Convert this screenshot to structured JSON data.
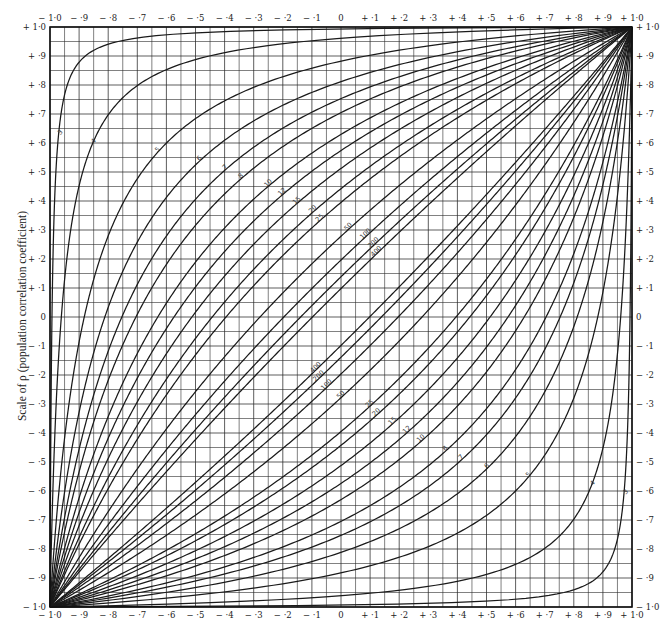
{
  "chart_data": {
    "type": "line",
    "title": "",
    "ylabel": "Scale of ρ (population correlation coefficient)",
    "xlabel": "",
    "xlim": [
      -1.0,
      1.0
    ],
    "ylim": [
      -1.0,
      1.0
    ],
    "grid": true,
    "grid_step": 0.05,
    "x_tick_labels": [
      "− 1·0",
      "− ·9",
      "− ·8",
      "− ·7",
      "− ·6",
      "− ·5",
      "− ·4",
      "− ·3",
      "− ·2",
      "− ·1",
      "0",
      "+ ·1",
      "+ ·2",
      "+ ·3",
      "+ ·4",
      "+ ·5",
      "+ ·6",
      "+ ·7",
      "+ ·8",
      "+ ·9",
      "+ 1·0"
    ],
    "y_tick_labels_left": [
      "+ 1·0",
      "+ ·9",
      "+ ·8",
      "+ ·7",
      "+ ·6",
      "+ ·5",
      "+ ·4",
      "+ ·3",
      "+ ·2",
      "+ ·1",
      "0",
      "− ·1",
      "− ·2",
      "− ·3",
      "− ·4",
      "− ·5",
      "− ·6",
      "− ·7",
      "− ·8",
      "− ·9",
      "− 1·0"
    ],
    "y_tick_labels_right": [
      "+ 1·0",
      "+ ·9",
      "+ ·8",
      "+ ·7",
      "+ ·6",
      "+ ·5",
      "+ ·4",
      "+ ·3",
      "+ ·2",
      "+ ·1",
      "0",
      "− ·1",
      "− ·2",
      "− ·3",
      "− ·4",
      "− ·5",
      "− ·6",
      "− ·7",
      "− ·8",
      "− ·9",
      "− 1·0"
    ],
    "series_sample_sizes": [
      3,
      4,
      5,
      6,
      7,
      8,
      10,
      12,
      15,
      20,
      25,
      50,
      100,
      200,
      400
    ],
    "series": [
      {
        "name": "upper belt",
        "labels": [
          "3",
          "4",
          "5",
          "6",
          "7",
          "8",
          "10",
          "12",
          "15",
          "20",
          "25",
          "50",
          "100",
          "200",
          "400"
        ]
      },
      {
        "name": "lower belt",
        "labels": [
          "3",
          "4",
          "5",
          "6",
          "7",
          "8",
          "10",
          "12",
          "15",
          "20",
          "25",
          "50",
          "100",
          "200",
          "400"
        ]
      }
    ],
    "z_multiplier": 1.96
  },
  "style": {
    "line_color": "#1a1a1a",
    "grid_color": "#2a2a2a",
    "text_color": "#222222"
  }
}
